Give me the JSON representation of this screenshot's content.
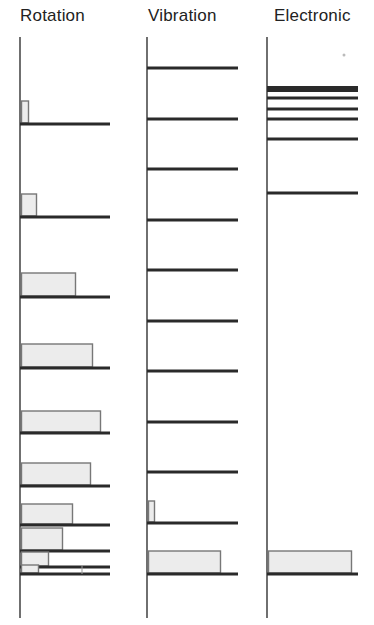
{
  "titles": {
    "rotation": "Rotation",
    "vibration": "Vibration",
    "electronic": "Electronic"
  },
  "colors": {
    "level_line": "#2a2a2a",
    "axis": "#333333",
    "bar_fill": "#ececec",
    "bar_stroke": "#777777"
  },
  "diagram": {
    "rotation": {
      "axis_x": 20,
      "axis_top": 37,
      "axis_bottom": 618,
      "line_x_end": 110,
      "levels": [
        {
          "y": 124,
          "bar_width": 7,
          "bar_height": 22
        },
        {
          "y": 217,
          "bar_width": 15,
          "bar_height": 22
        },
        {
          "y": 297,
          "bar_width": 54,
          "bar_height": 23
        },
        {
          "y": 368,
          "bar_width": 71,
          "bar_height": 23
        },
        {
          "y": 433,
          "bar_width": 79,
          "bar_height": 21
        },
        {
          "y": 486,
          "bar_width": 69,
          "bar_height": 22
        },
        {
          "y": 525,
          "bar_width": 51,
          "bar_height": 20
        },
        {
          "y": 551,
          "bar_width": 41,
          "bar_height": 22
        },
        {
          "y": 567,
          "bar_width": 27,
          "bar_height": 14
        },
        {
          "y": 574,
          "bar_width": 17,
          "bar_height": 8
        }
      ]
    },
    "vibration": {
      "axis_x": 147,
      "axis_top": 37,
      "axis_bottom": 618,
      "line_x_end": 238,
      "levels": [
        {
          "y": 68,
          "bar_width": 0,
          "bar_height": 0
        },
        {
          "y": 119,
          "bar_width": 0,
          "bar_height": 0
        },
        {
          "y": 169,
          "bar_width": 0,
          "bar_height": 0
        },
        {
          "y": 220,
          "bar_width": 0,
          "bar_height": 0
        },
        {
          "y": 270,
          "bar_width": 0,
          "bar_height": 0
        },
        {
          "y": 321,
          "bar_width": 0,
          "bar_height": 0
        },
        {
          "y": 371,
          "bar_width": 0,
          "bar_height": 0
        },
        {
          "y": 422,
          "bar_width": 0,
          "bar_height": 0
        },
        {
          "y": 472,
          "bar_width": 0,
          "bar_height": 0
        },
        {
          "y": 523,
          "bar_width": 6,
          "bar_height": 21
        },
        {
          "y": 574,
          "bar_width": 72,
          "bar_height": 22
        }
      ]
    },
    "electronic": {
      "axis_x": 267,
      "axis_top": 37,
      "axis_bottom": 618,
      "line_x_end": 358,
      "levels": [
        {
          "y": 89,
          "thickness": 6,
          "bar_width": 0,
          "bar_height": 0
        },
        {
          "y": 98,
          "thickness": 3,
          "bar_width": 0,
          "bar_height": 0
        },
        {
          "y": 109,
          "thickness": 3,
          "bar_width": 0,
          "bar_height": 0
        },
        {
          "y": 119,
          "thickness": 3,
          "bar_width": 0,
          "bar_height": 0
        },
        {
          "y": 139,
          "thickness": 3,
          "bar_width": 0,
          "bar_height": 0
        },
        {
          "y": 193,
          "thickness": 3,
          "bar_width": 0,
          "bar_height": 0
        },
        {
          "y": 574,
          "thickness": 3,
          "bar_width": 83,
          "bar_height": 22
        }
      ]
    }
  }
}
